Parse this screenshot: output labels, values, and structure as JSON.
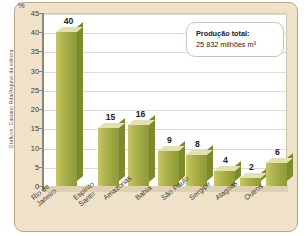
{
  "credit": "Gráficos: Casiano Rda/Arquivo da editora",
  "callout": {
    "title": "Produção total:",
    "value": "25 832 milhões m³"
  },
  "axis": {
    "unit": "%",
    "ticks": [
      "45",
      "40",
      "35",
      "30",
      "25",
      "20",
      "15",
      "10",
      "5",
      "0"
    ]
  },
  "chart_data": {
    "type": "bar",
    "title": "",
    "xlabel": "",
    "ylabel": "%",
    "ylim": [
      0,
      45
    ],
    "ytick_values": [
      0,
      5,
      10,
      15,
      20,
      25,
      30,
      35,
      40,
      45
    ],
    "grid": true,
    "legend": null,
    "categories": [
      "Rio de Janeiro",
      "Espírito Santo",
      "Amazonas",
      "Bahia",
      "São Paulo",
      "Sergipe",
      "Alagoas",
      "Outros"
    ],
    "category_lines": [
      [
        "Rio de",
        "Janeiro"
      ],
      [
        "Espírito",
        "Santo"
      ],
      [
        "Amazonas"
      ],
      [
        "Bahia"
      ],
      [
        "São Paulo"
      ],
      [
        "Sergipe"
      ],
      [
        "Alagoas"
      ],
      [
        "Outros"
      ]
    ],
    "values": [
      40,
      15,
      16,
      9,
      8,
      4,
      2,
      6
    ],
    "value_labels": [
      "40",
      "15",
      "16",
      "9",
      "8",
      "4",
      "2",
      "6"
    ],
    "annotations": [
      {
        "text": "Produção total: 25 832 milhões m³",
        "x": 0.62,
        "y": 0.86
      }
    ],
    "colors": {
      "bar_front_light": "#c9c864",
      "bar_front_dark": "#8f9b3a",
      "bar_side": "#7d8a2e",
      "bar_top": "#e3e2a8",
      "panel_background": "#f0e2c8",
      "plot_background": "#ffffff",
      "grid": "#dfdcd6",
      "axis": "#8d8577"
    }
  }
}
